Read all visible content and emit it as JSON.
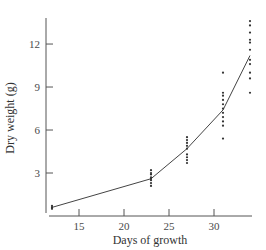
{
  "chart_data": {
    "type": "scatter",
    "title": "",
    "xlabel": "Days of growth",
    "ylabel": "Dry weight (g)",
    "xlim": [
      12,
      34
    ],
    "ylim": [
      0,
      14
    ],
    "x_ticks": [
      15,
      20,
      25,
      30
    ],
    "y_ticks": [
      3,
      6,
      9,
      12
    ],
    "grid": false,
    "legend": null,
    "series": [
      {
        "name": "observations",
        "kind": "scatter",
        "points": [
          {
            "x": 12,
            "y": 0.5
          },
          {
            "x": 12,
            "y": 0.6
          },
          {
            "x": 12,
            "y": 0.7
          },
          {
            "x": 23,
            "y": 2.1
          },
          {
            "x": 23,
            "y": 2.3
          },
          {
            "x": 23,
            "y": 2.5
          },
          {
            "x": 23,
            "y": 2.6
          },
          {
            "x": 23,
            "y": 2.7
          },
          {
            "x": 23,
            "y": 2.9
          },
          {
            "x": 23,
            "y": 3.0
          },
          {
            "x": 23,
            "y": 3.2
          },
          {
            "x": 27,
            "y": 3.7
          },
          {
            "x": 27,
            "y": 3.9
          },
          {
            "x": 27,
            "y": 4.1
          },
          {
            "x": 27,
            "y": 4.3
          },
          {
            "x": 27,
            "y": 4.7
          },
          {
            "x": 27,
            "y": 4.9
          },
          {
            "x": 27,
            "y": 5.1
          },
          {
            "x": 27,
            "y": 5.3
          },
          {
            "x": 27,
            "y": 5.5
          },
          {
            "x": 31,
            "y": 5.4
          },
          {
            "x": 31,
            "y": 6.3
          },
          {
            "x": 31,
            "y": 6.6
          },
          {
            "x": 31,
            "y": 6.9
          },
          {
            "x": 31,
            "y": 7.2
          },
          {
            "x": 31,
            "y": 7.5
          },
          {
            "x": 31,
            "y": 7.8
          },
          {
            "x": 31,
            "y": 8.1
          },
          {
            "x": 31,
            "y": 8.4
          },
          {
            "x": 31,
            "y": 8.6
          },
          {
            "x": 31,
            "y": 10.0
          },
          {
            "x": 34,
            "y": 8.6
          },
          {
            "x": 34,
            "y": 9.6
          },
          {
            "x": 34,
            "y": 10.0
          },
          {
            "x": 34,
            "y": 10.6
          },
          {
            "x": 34,
            "y": 10.9
          },
          {
            "x": 34,
            "y": 11.6
          },
          {
            "x": 34,
            "y": 12.1
          },
          {
            "x": 34,
            "y": 12.3
          },
          {
            "x": 34,
            "y": 12.8
          },
          {
            "x": 34,
            "y": 13.3
          },
          {
            "x": 34,
            "y": 13.6
          }
        ]
      },
      {
        "name": "mean trend",
        "kind": "line",
        "points": [
          {
            "x": 12,
            "y": 0.6
          },
          {
            "x": 23,
            "y": 2.6
          },
          {
            "x": 27,
            "y": 4.7
          },
          {
            "x": 31,
            "y": 7.4
          },
          {
            "x": 34,
            "y": 11.2
          }
        ]
      }
    ]
  },
  "layout": {
    "plot": {
      "x0": 46,
      "x1": 252,
      "y_axis_top": 18,
      "x_axis_y": 216
    },
    "x_map": {
      "day": 12,
      "px": 52,
      "px_per_unit": 9
    },
    "y_map": {
      "val": 0,
      "px": 216,
      "px_per_unit": 14.33
    },
    "colors": {
      "axis": "#555555",
      "line": "#444444",
      "points": "#333333",
      "text": "#4a4a4a"
    }
  }
}
